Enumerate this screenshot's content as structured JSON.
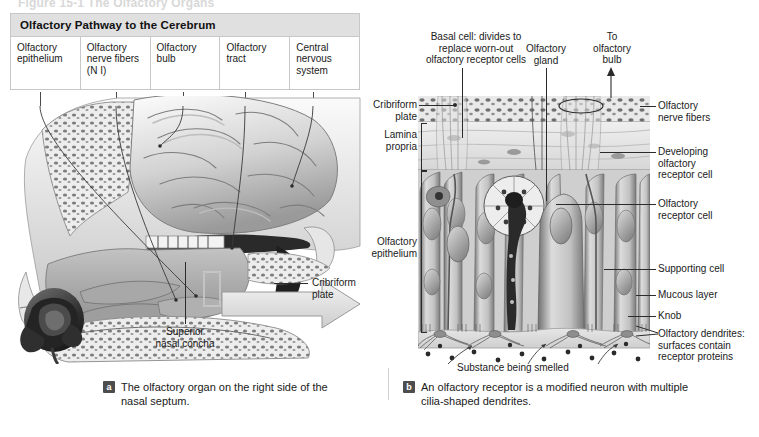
{
  "figure": {
    "top_caption": "Figure 15-1  The Olfactory Organs"
  },
  "pathway_table": {
    "title": "Olfactory Pathway to the Cerebrum",
    "cells": [
      "Olfactory\nepithelium",
      "Olfactory\nnerve\nfibers (N I)",
      "Olfactory\nbulb",
      "Olfactory\ntract",
      "Central\nnervous\nsystem"
    ]
  },
  "panel_a": {
    "badge": "a",
    "caption": "The olfactory organ on the right side of the nasal septum.",
    "labels": {
      "cribriform_plate": "Cribriform\nplate",
      "superior_nasal_concha": "Superior\nnasal concha"
    }
  },
  "panel_b": {
    "badge": "b",
    "caption": "An olfactory receptor is a modified neuron with multiple cilia-shaped dendrites.",
    "labels": {
      "basal_cell": "Basal cell: divides to\nreplace worn-out\nolfactory receptor cells",
      "olfactory_gland": "Olfactory\ngland",
      "to_olfactory_bulb": "To\nolfactory\nbulb",
      "cribriform_plate": "Cribriform\nplate",
      "lamina_propria": "Lamina\npropria",
      "olfactory_epithelium": "Olfactory\nepithelium",
      "olfactory_nerve_fibers": "Olfactory\nnerve fibers",
      "developing_receptor_cell": "Developing\nolfactory\nreceptor cell",
      "olfactory_receptor_cell": "Olfactory\nreceptor cell",
      "supporting_cell": "Supporting cell",
      "mucous_layer": "Mucous layer",
      "knob": "Knob",
      "olfactory_dendrites": "Olfactory dendrites:\nsurfaces contain\nreceptor proteins",
      "substance_being_smelled": "Substance being smelled"
    }
  },
  "colors": {
    "table_header_bg": "#e0e0e0",
    "table_border": "#c8c8c8",
    "badge_bg": "#4d4d4d",
    "text": "#1a1a1a",
    "leader_line": "#2b2b2b"
  }
}
